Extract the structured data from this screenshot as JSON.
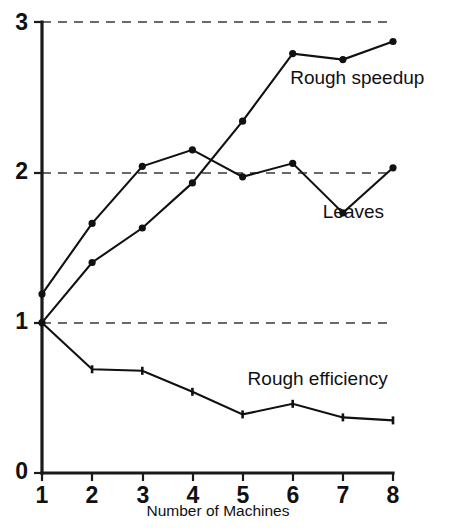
{
  "chart_data": {
    "type": "line",
    "title": "",
    "subtitle": "",
    "xlabel": "Number of Machines",
    "ylabel": "",
    "x": [
      1,
      2,
      3,
      4,
      5,
      6,
      7,
      8
    ],
    "xlim": [
      1,
      8
    ],
    "ylim": [
      0,
      3
    ],
    "xticks": [
      "1",
      "2",
      "3",
      "4",
      "5",
      "6",
      "7",
      "8"
    ],
    "yticks": [
      "0",
      "1",
      "2",
      "3"
    ],
    "grid": "horizontal dashed gridlines at y = 1, 2, 3",
    "legend_position": "inline labels at right of each curve",
    "series": [
      {
        "name": "Rough speedup",
        "marker": "filled-circle",
        "label_x": 5.95,
        "label_y": 2.62,
        "values": [
          1.0,
          1.4,
          1.63,
          1.93,
          2.34,
          2.79,
          2.75,
          2.87
        ]
      },
      {
        "name": "Leaves",
        "marker": "filled-circle",
        "label_x": 6.6,
        "label_y": 1.73,
        "values": [
          1.19,
          1.66,
          2.04,
          2.15,
          1.97,
          2.06,
          1.73,
          2.03
        ]
      },
      {
        "name": "Rough efficiency",
        "marker": "plus-tick",
        "label_x": 5.1,
        "label_y": 0.62,
        "values": [
          1.0,
          0.69,
          0.68,
          0.54,
          0.39,
          0.46,
          0.37,
          0.35
        ]
      }
    ]
  },
  "colors": {
    "ink": "#111111",
    "grid": "#3a3a3a",
    "background": "#ffffff"
  }
}
